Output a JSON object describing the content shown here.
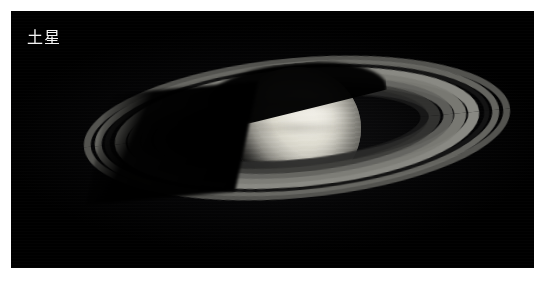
{
  "page": {
    "background_color": "#ffffff"
  },
  "photo": {
    "name": "saturn-photograph",
    "background_color": "#000000",
    "caption": "土星",
    "caption_color": "#f4f4f4",
    "subject": "Saturn",
    "frame": {
      "x": 11,
      "y": 11,
      "width": 523,
      "height": 257
    }
  },
  "scene": {
    "planet": {
      "label": "saturn-globe",
      "center_x": 286,
      "center_y": 117,
      "width": 128,
      "height": 123,
      "highlight_color": "#f2f0e9",
      "midtone_color": "#c9c7bd",
      "shadow_color": "#1a1a19"
    },
    "rings": {
      "tilt_degrees": -5.2,
      "outer_left_edge_x": 48,
      "outer_right_edge_x": 476,
      "bands": [
        {
          "name": "a-ring-outer",
          "rx": 214,
          "ry": 70,
          "thickness": 7,
          "color": "#585854",
          "opacity": 0.95
        },
        {
          "name": "a-ring-inner",
          "rx": 203,
          "ry": 66,
          "thickness": 7,
          "color": "#6a6a65",
          "opacity": 0.95
        },
        {
          "name": "cassini-division",
          "rx": 193,
          "ry": 62,
          "thickness": 5,
          "color": "#141414",
          "opacity": 1
        },
        {
          "name": "b-ring-outer",
          "rx": 183,
          "ry": 59,
          "thickness": 11,
          "color": "#8c8c86",
          "opacity": 0.98
        },
        {
          "name": "b-ring-mid",
          "rx": 170,
          "ry": 54,
          "thickness": 12,
          "color": "#7d7d77",
          "opacity": 0.96
        },
        {
          "name": "b-ring-inner",
          "rx": 157,
          "ry": 49,
          "thickness": 10,
          "color": "#646460",
          "opacity": 0.92
        },
        {
          "name": "c-ring",
          "rx": 144,
          "ry": 44,
          "thickness": 12,
          "color": "#3a3a38",
          "opacity": 0.85
        },
        {
          "name": "d-ring-inner-haze",
          "rx": 132,
          "ry": 39,
          "thickness": 8,
          "color": "#242423",
          "opacity": 0.6
        }
      ],
      "shadows": [
        {
          "name": "ring-shadow-on-planet"
        },
        {
          "name": "planet-shadow-on-rings"
        }
      ]
    }
  }
}
